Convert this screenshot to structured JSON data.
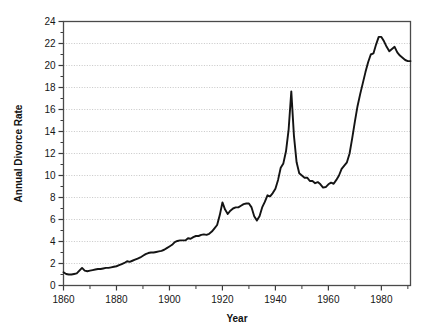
{
  "chart_data": {
    "type": "line",
    "title": "",
    "subtitle": "",
    "xlabel": "Year",
    "ylabel": "Annual Divorce Rate",
    "xlim": [
      1860,
      1991
    ],
    "ylim": [
      0,
      24
    ],
    "grid": "horizontal-dotted",
    "legend": "none",
    "x_ticks": [
      1860,
      1880,
      1900,
      1920,
      1940,
      1960,
      1980
    ],
    "x_tick_labels": [
      "1860",
      "1880",
      "1900",
      "1920",
      "1940",
      "1960",
      "1980"
    ],
    "x_minor_tick_step": 10,
    "y_ticks": [
      0,
      2,
      4,
      6,
      8,
      10,
      12,
      14,
      16,
      18,
      20,
      22,
      24
    ],
    "y_tick_labels": [
      "0",
      "2",
      "4",
      "6",
      "8",
      "10",
      "12",
      "14",
      "16",
      "18",
      "20",
      "22",
      "24"
    ],
    "y_minor_tick_step": 1,
    "line_color": "#141414",
    "grid_color": "#b9b9b9",
    "frame_color": "#4a4a4a",
    "series": [
      {
        "name": "Annual Divorce Rate",
        "x": [
          1860,
          1861,
          1862,
          1863,
          1864,
          1865,
          1866,
          1867,
          1868,
          1869,
          1870,
          1871,
          1872,
          1873,
          1874,
          1875,
          1876,
          1877,
          1878,
          1879,
          1880,
          1881,
          1882,
          1883,
          1884,
          1885,
          1886,
          1887,
          1888,
          1889,
          1890,
          1891,
          1892,
          1893,
          1894,
          1895,
          1896,
          1897,
          1898,
          1899,
          1900,
          1901,
          1902,
          1903,
          1904,
          1905,
          1906,
          1907,
          1908,
          1909,
          1910,
          1911,
          1912,
          1913,
          1914,
          1915,
          1916,
          1917,
          1918,
          1919,
          1920,
          1921,
          1922,
          1923,
          1924,
          1925,
          1926,
          1927,
          1928,
          1929,
          1930,
          1931,
          1932,
          1933,
          1934,
          1935,
          1936,
          1937,
          1938,
          1939,
          1940,
          1941,
          1942,
          1943,
          1944,
          1945,
          1946,
          1947,
          1948,
          1949,
          1950,
          1951,
          1952,
          1953,
          1954,
          1955,
          1956,
          1957,
          1958,
          1959,
          1960,
          1961,
          1962,
          1963,
          1964,
          1965,
          1966,
          1967,
          1968,
          1969,
          1970,
          1971,
          1972,
          1973,
          1974,
          1975,
          1976,
          1977,
          1978,
          1979,
          1980,
          1981,
          1982,
          1983,
          1984,
          1985,
          1986,
          1987,
          1988,
          1989,
          1990,
          1991
        ],
        "values": [
          1.2,
          1.05,
          1.0,
          1.0,
          1.05,
          1.1,
          1.35,
          1.6,
          1.35,
          1.3,
          1.35,
          1.4,
          1.45,
          1.5,
          1.5,
          1.55,
          1.6,
          1.6,
          1.65,
          1.7,
          1.75,
          1.85,
          1.95,
          2.05,
          2.2,
          2.15,
          2.25,
          2.35,
          2.45,
          2.55,
          2.7,
          2.85,
          2.95,
          3.0,
          3.0,
          3.05,
          3.1,
          3.15,
          3.25,
          3.4,
          3.55,
          3.7,
          3.95,
          4.05,
          4.1,
          4.1,
          4.1,
          4.3,
          4.25,
          4.4,
          4.5,
          4.5,
          4.6,
          4.65,
          4.6,
          4.7,
          4.9,
          5.2,
          5.5,
          6.4,
          7.55,
          6.9,
          6.5,
          6.8,
          7.0,
          7.1,
          7.1,
          7.25,
          7.4,
          7.45,
          7.45,
          7.1,
          6.3,
          5.9,
          6.3,
          7.1,
          7.6,
          8.2,
          8.1,
          8.4,
          8.8,
          9.6,
          10.7,
          11.1,
          12.2,
          14.2,
          17.65,
          13.6,
          11.2,
          10.2,
          10.0,
          9.8,
          9.8,
          9.5,
          9.5,
          9.3,
          9.4,
          9.2,
          8.9,
          8.95,
          9.2,
          9.35,
          9.25,
          9.6,
          10.0,
          10.6,
          10.9,
          11.2,
          12.0,
          13.4,
          14.9,
          16.3,
          17.4,
          18.4,
          19.4,
          20.3,
          21.0,
          21.1,
          21.9,
          22.6,
          22.6,
          22.2,
          21.7,
          21.3,
          21.5,
          21.7,
          21.2,
          20.9,
          20.7,
          20.5,
          20.4,
          20.4
        ]
      }
    ]
  }
}
